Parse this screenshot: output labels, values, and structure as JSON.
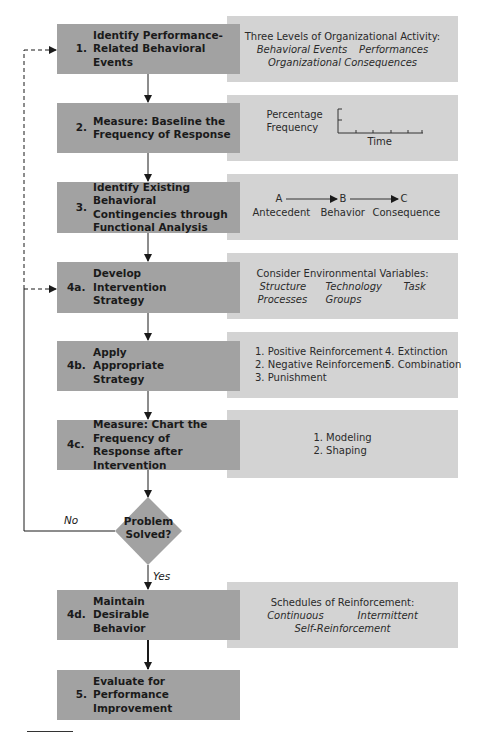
{
  "steps": [
    {
      "id": "1",
      "num": "1.",
      "label": "Identify Performance-Related Behavioral Events"
    },
    {
      "id": "2",
      "num": "2.",
      "label": "Measure: Baseline the Frequency of Response"
    },
    {
      "id": "3",
      "num": "3.",
      "label": "Identify Existing Behavioral Contingencies through Functional Analysis"
    },
    {
      "id": "4a",
      "num": "4a.",
      "label": "Develop Intervention Strategy"
    },
    {
      "id": "4b",
      "num": "4b.",
      "label": "Apply Appropriate Strategy"
    },
    {
      "id": "4c",
      "num": "4c.",
      "label": "Measure: Chart the Frequency of Response after Intervention"
    },
    {
      "id": "4d",
      "num": "4d.",
      "label": "Maintain Desirable Behavior"
    },
    {
      "id": "5",
      "num": "5.",
      "label": "Evaluate for Performance Improvement"
    }
  ],
  "decision": {
    "label": "Problem Solved?",
    "no": "No",
    "yes": "Yes"
  },
  "panels": {
    "p1": {
      "title": "Three Levels of Organizational Activity:",
      "items": [
        "Behavioral Events",
        "Performances",
        "Organizational Consequences"
      ]
    },
    "p2": {
      "ylabel1": "Percentage",
      "ylabel2": "Frequency",
      "xlabel": "Time"
    },
    "p3": {
      "a": "A",
      "b": "B",
      "c": "C",
      "a_label": "Antecedent",
      "b_label": "Behavior",
      "c_label": "Consequence"
    },
    "p4": {
      "title": "Consider Environmental Variables:",
      "items": [
        "Structure",
        "Technology",
        "Task",
        "Processes",
        "Groups"
      ]
    },
    "p5": {
      "items": [
        "1.  Positive Reinforcement",
        "2.  Negative Reinforcement",
        "3.  Punishment",
        "4.  Extinction",
        "5.  Combination"
      ]
    },
    "p6": {
      "items": [
        "1.  Modeling",
        "2.  Shaping"
      ]
    },
    "p7": {
      "title": "Schedules of Reinforcement:",
      "items": [
        "Continuous",
        "Intermittent",
        "Self-Reinforcement"
      ]
    }
  },
  "colors": {
    "step_fill": "#a2a2a2",
    "panel_fill": "#d3d3d3",
    "line": "#1a1a1a"
  }
}
